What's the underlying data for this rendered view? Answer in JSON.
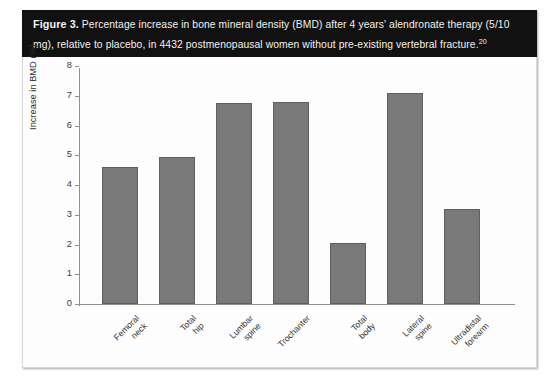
{
  "figure": {
    "label": "Figure 3.",
    "caption": " Percentage increase in bone mineral density (BMD) after 4 years' alendronate therapy (5/10 mg), relative to placebo, in 4432 postmenopausal women without pre-existing vertebral fracture.",
    "reference": "20"
  },
  "colors": {
    "caption_band": "#111111",
    "caption_text": "#f2f2f2",
    "bar_fill": "#797979",
    "bar_border": "#5f5f5f",
    "axis_line": "#909090",
    "plot_background": "#fdfdfd"
  },
  "chart_data": {
    "type": "bar",
    "title": "",
    "xlabel": "",
    "ylabel": "Increase in BMD (%)",
    "ylim": [
      0,
      8
    ],
    "yticks": [
      0,
      1,
      2,
      3,
      4,
      5,
      6,
      7,
      8
    ],
    "grid": false,
    "legend": null,
    "categories": [
      "Femoral neck",
      "Total hip",
      "Lumbar spine",
      "Trochanter",
      "Total body",
      "Lateral spine",
      "Ultradistal forearm"
    ],
    "category_lines": [
      [
        "Femoral",
        "neck"
      ],
      [
        "Total",
        "hip"
      ],
      [
        "Lumbar",
        "spine"
      ],
      [
        "Trochanter",
        ""
      ],
      [
        "Total",
        "body"
      ],
      [
        "Lateral",
        "spine"
      ],
      [
        "Ultradistal",
        "forearm"
      ]
    ],
    "values": [
      4.6,
      4.95,
      6.75,
      6.8,
      2.05,
      7.1,
      3.2
    ]
  }
}
